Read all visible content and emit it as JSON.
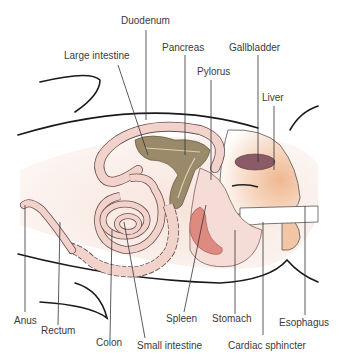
{
  "diagram": {
    "type": "anatomical-illustration",
    "colors": {
      "body_fill": "#faf0ea",
      "intestine": "#f2d3cc",
      "intestine_stroke": "#6b4e4e",
      "pancreas": "#9a8a6a",
      "gallbladder": "#8a5a66",
      "liver": "#f3c9a8",
      "stomach": "#f6dcd6",
      "spleen": "#de8a80",
      "outline": "#1a1a1a"
    },
    "labels": {
      "duodenum": "Duodenum",
      "large_intestine": "Large intestine",
      "pancreas": "Pancreas",
      "gallbladder": "Gallbladder",
      "pylorus": "Pylorus",
      "liver": "Liver",
      "anus": "Anus",
      "rectum": "Rectum",
      "colon": "Colon",
      "small_intestine": "Small intestine",
      "spleen": "Spleen",
      "stomach": "Stomach",
      "cardiac_sphincter": "Cardiac sphincter",
      "esophagus": "Esophagus"
    }
  }
}
